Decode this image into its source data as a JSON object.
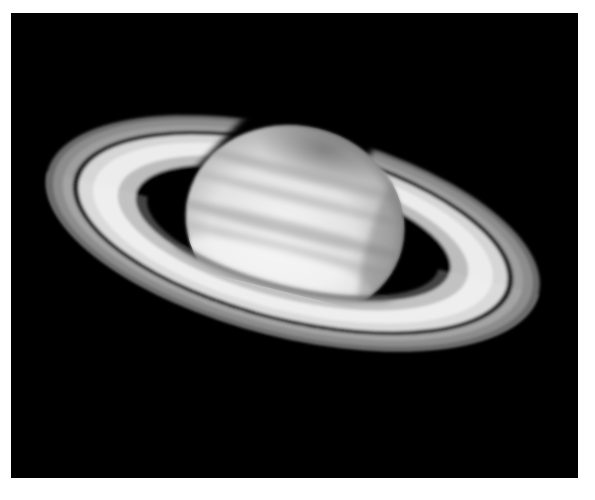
{
  "image": {
    "subject": "Saturn with its ring system",
    "description": "Grayscale telescope photograph of Saturn on a black background, rings tilted and shown with the Cassini division",
    "colors": {
      "background": "#000000",
      "border": "#ffffff",
      "ring_bright": "#e8e8e8",
      "ring_outer": "#8a8a8a",
      "planet_light": "#f0f0f0",
      "planet_dark": "#9a9a9a"
    }
  }
}
